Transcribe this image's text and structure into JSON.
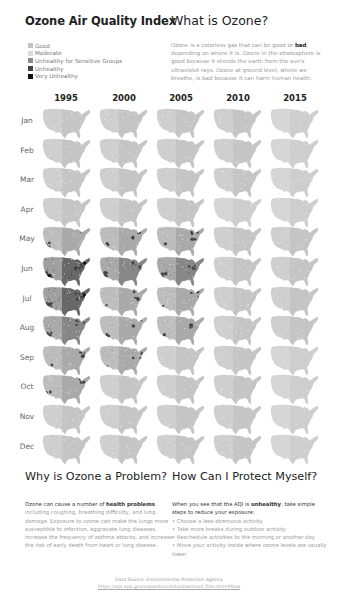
{
  "header": {
    "title": "Ozone Air Quality Index"
  },
  "legend": {
    "items": [
      {
        "label": "Good",
        "color": "#c8c8c8"
      },
      {
        "label": "Moderate",
        "color": "#dcdcdc"
      },
      {
        "label": "Unhealthy for Sensitive Groups",
        "color": "#8c8c8c"
      },
      {
        "label": "Unhealthy",
        "color": "#444444"
      },
      {
        "label": "Very Unhealthy",
        "color": "#111111"
      }
    ]
  },
  "what_is": {
    "title": "What is Ozone?",
    "text_before": "Ozone is a colorless gas that can be good or ",
    "bold": "bad",
    "text_after": ", depending on where it is. Ozone in the stratosphere is good because it shields the earth from the sun's ultraviolet rays. Ozone at ground level, where we breathe, is bad because it can harm human health."
  },
  "chart_data": {
    "type": "heatmap",
    "title": "Ozone Air Quality Index",
    "columns": [
      "1995",
      "2000",
      "2005",
      "2010",
      "2015"
    ],
    "rows": [
      "Jan",
      "Feb",
      "Mar",
      "Apr",
      "May",
      "Jun",
      "Jul",
      "Aug",
      "Sep",
      "Oct",
      "Nov",
      "Dec"
    ],
    "legend": [
      "Good",
      "Moderate",
      "Unhealthy for Sensitive Groups",
      "Unhealthy",
      "Very Unhealthy"
    ],
    "relative_severity": [
      [
        2,
        2,
        2,
        2,
        1
      ],
      [
        2,
        2,
        2,
        2,
        1
      ],
      [
        2,
        2,
        2,
        2,
        1
      ],
      [
        2,
        2,
        2,
        1,
        1
      ],
      [
        3,
        3,
        3,
        2,
        2
      ],
      [
        5,
        4,
        4,
        2,
        2
      ],
      [
        5,
        3,
        3,
        2,
        2
      ],
      [
        4,
        3,
        3,
        2,
        2
      ],
      [
        3,
        3,
        2,
        2,
        1
      ],
      [
        3,
        2,
        2,
        2,
        1
      ],
      [
        2,
        2,
        2,
        2,
        1
      ],
      [
        2,
        2,
        2,
        2,
        1
      ]
    ]
  },
  "grid": {
    "years": [
      "1995",
      "2000",
      "2005",
      "2010",
      "2015"
    ],
    "months": [
      "Jan",
      "Feb",
      "Mar",
      "Apr",
      "May",
      "Jun",
      "Jul",
      "Aug",
      "Sep",
      "Oct",
      "Nov",
      "Dec"
    ]
  },
  "why_problem": {
    "title": "Why is Ozone a Problem?",
    "text_dark": "Ozone can cause a number of ",
    "bold": "health problems",
    "text_after": ", including coughing, breathing difficulty, and lung damage. Exposure to ozone can make the lungs more susceptible to infection, aggravate lung diseases, increase the frequency of asthma attacks, and increase the risk of early death from heart or lung disease."
  },
  "protect": {
    "title": "How Can I Protect Myself?",
    "intro_before": "When you see that the AQI is ",
    "intro_bold": "unhealthy",
    "intro_after": ", take simple steps to reduce your exposure:",
    "bullets": [
      "• Choose a less-strenuous activity",
      "• Take more breaks during outdoor activity",
      "• Reschedule activities to the morning or another day",
      "• Move your activity inside where ozone levels are usually lower"
    ]
  },
  "footer": {
    "source": "Data Source: Environmental Protection Agency",
    "url": "https://aqs.epa.gov/aqsweb/airdata/download_files.html#Raw"
  }
}
